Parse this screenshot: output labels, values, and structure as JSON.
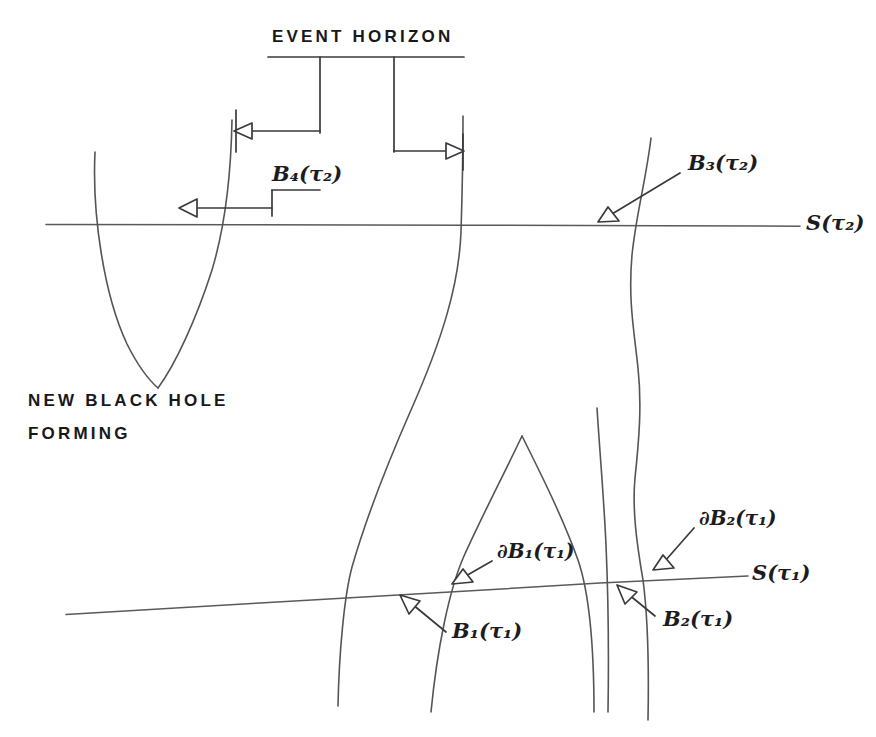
{
  "figure": {
    "title_caption": "EVENT HORIZON",
    "note_line1": "NEW BLACK HOLE",
    "note_line2": "FORMING",
    "ink_color": "#555558",
    "text_color": "#18181a",
    "background": "#ffffff"
  },
  "labels": {
    "slice_upper": {
      "base": "S",
      "open": "(",
      "sym": "τ",
      "sub": "2",
      "close": ")"
    },
    "slice_lower": {
      "base": "S",
      "open": "(",
      "sym": "τ",
      "sub": "1",
      "close": ")"
    },
    "b4": {
      "base": "B",
      "bsub": "4",
      "open": "(",
      "sym": "τ",
      "sub": "2",
      "close": ")"
    },
    "b3": {
      "base": "B",
      "bsub": "3",
      "open": "(",
      "sym": "τ",
      "sub": "2",
      "close": ")"
    },
    "b1": {
      "base": "B",
      "bsub": "1",
      "open": "(",
      "sym": "τ",
      "sub": "1",
      "close": ")"
    },
    "b2": {
      "base": "B",
      "bsub": "2",
      "open": "(",
      "sym": "τ",
      "sub": "1",
      "close": ")"
    },
    "db1": {
      "partial": "∂",
      "base": "B",
      "bsub": "1",
      "open": "(",
      "sym": "τ",
      "sub": "1",
      "close": ")"
    },
    "db2": {
      "partial": "∂",
      "base": "B",
      "bsub": "2",
      "open": "(",
      "sym": "τ",
      "sub": "1",
      "close": ")"
    }
  },
  "label_text": {
    "slice_upper": "S(τ₂)",
    "slice_lower": "S(τ₁)",
    "b4": "B₄(τ₂)",
    "b3": "B₃(τ₂)",
    "b1": "B₁(τ₁)",
    "b2": "B₂(τ₁)",
    "db1": "∂B₁(τ₁)",
    "db2": "∂B₂(τ₁)"
  },
  "geometry": {
    "slice_upper_line": {
      "x1": 46,
      "y1": 224,
      "x2": 800,
      "y2": 226
    },
    "slice_lower_line": {
      "x1": 66,
      "y1": 614,
      "x2": 748,
      "y2": 576
    },
    "caption_rule": {
      "x1": 268,
      "y1": 57,
      "x2": 464,
      "y2": 57
    },
    "leader_drop_left": {
      "x": 320,
      "y1": 57,
      "y2": 133
    },
    "leader_drop_right": {
      "x": 394,
      "y1": 57,
      "y2": 152
    },
    "horizon_arrow_left": {
      "from_x": 320,
      "to_x": 236,
      "y": 131
    },
    "horizon_arrow_right": {
      "from_x": 394,
      "to_x": 462,
      "y": 151
    },
    "b4_arrow": {
      "from_x": 272,
      "to_x": 180,
      "y": 208
    },
    "new_hole_vertex": {
      "x": 158,
      "y": 388
    },
    "inner_peak_apex": {
      "x": 522,
      "y": 436
    }
  }
}
